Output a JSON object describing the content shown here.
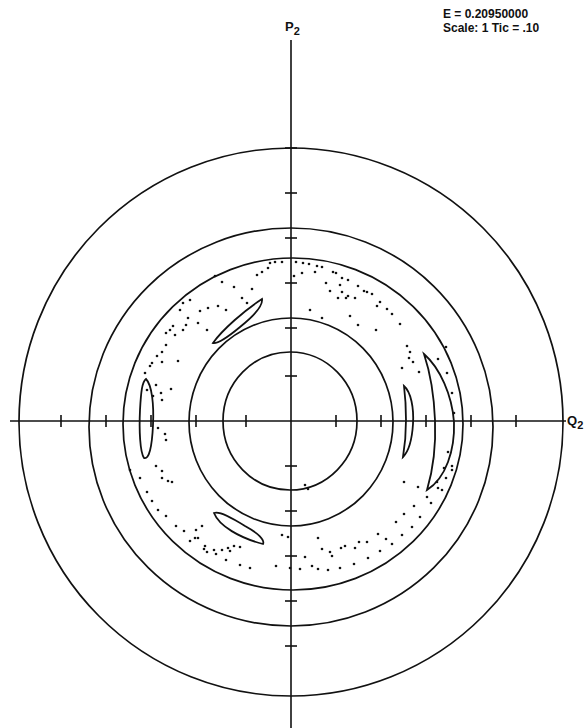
{
  "info": {
    "energy_line": "E = 0.20950000",
    "scale_line": "Scale: 1 Tic = .10"
  },
  "axes": {
    "y_label_main": "P",
    "y_label_sub": "2",
    "x_label_main": "Q",
    "x_label_sub": "2"
  },
  "chart_data": {
    "type": "scatter",
    "xlabel": "Q2",
    "ylabel": "P2",
    "annotations": [
      "E = 0.20950000",
      "Scale: 1 Tic = .10"
    ],
    "tick_spacing": 0.1,
    "xlim": [
      -0.62,
      0.62
    ],
    "ylim": [
      -0.67,
      0.92
    ],
    "grid": false,
    "legend": null,
    "pixel_geometry": {
      "center": [
        291,
        421
      ],
      "px_per_tick": 45,
      "x_axis_extent": [
        10,
        566
      ],
      "y_axis_extent": [
        40,
        728
      ],
      "x_ticks_px": [
        61,
        106,
        151,
        196,
        246,
        336,
        381,
        426,
        471,
        516
      ],
      "y_ticks_px": [
        148,
        193,
        238,
        283,
        328,
        376,
        466,
        511,
        556,
        601,
        646
      ]
    },
    "invariant_curves": [
      {
        "name": "outer-torus",
        "cx": 291,
        "cy": 422,
        "rx": 272,
        "ry": 274,
        "radius_units": 0.61
      },
      {
        "name": "torus-2",
        "cx": 291,
        "cy": 427,
        "rx": 202,
        "ry": 199,
        "radius_units": 0.45
      },
      {
        "name": "chaotic-band-outer",
        "cx": 293,
        "cy": 424,
        "rx": 170,
        "ry": 166,
        "radius_units": 0.37
      },
      {
        "name": "torus-4",
        "cx": 291,
        "cy": 422,
        "rx": 102,
        "ry": 104,
        "radius_units": 0.23
      },
      {
        "name": "inner-torus",
        "cx": 290,
        "cy": 421,
        "rx": 67,
        "ry": 69,
        "radius_units": 0.15
      }
    ],
    "islands": [
      {
        "name": "island-right-large",
        "path": "M424,354 C440,368 452,395 454,422 C455,450 446,478 427,490 C433,470 436,445 435,420 C434,395 430,372 424,354 Z"
      },
      {
        "name": "island-right-small",
        "path": "M404,386 C411,392 414,408 413,424 C412,440 408,452 403,457 C405,445 406,432 406,420 C406,405 405,394 404,386 Z"
      },
      {
        "name": "island-left",
        "path": "M146,379 C152,385 154,405 153,425 C152,447 149,460 144,458 C140,452 139,430 140,410 C141,392 142,382 146,379 Z"
      },
      {
        "name": "island-upper-left",
        "path": "M213,343 C222,330 245,310 262,299 C263,305 255,315 240,327 C228,337 218,344 213,343 Z"
      },
      {
        "name": "island-lower-left",
        "path": "M214,513 C219,526 240,538 263,544 C265,540 258,533 245,526 C232,518 220,511 214,513 Z"
      }
    ],
    "chaotic_points": [
      [
        296,
        262
      ],
      [
        303,
        263
      ],
      [
        309,
        264
      ],
      [
        317,
        266
      ],
      [
        322,
        267
      ],
      [
        333,
        272
      ],
      [
        336,
        273
      ],
      [
        342,
        278
      ],
      [
        348,
        280
      ],
      [
        358,
        286
      ],
      [
        364,
        291
      ],
      [
        372,
        294
      ],
      [
        380,
        302
      ],
      [
        294,
        276
      ],
      [
        302,
        273
      ],
      [
        315,
        272
      ],
      [
        326,
        283
      ],
      [
        330,
        291
      ],
      [
        340,
        285
      ],
      [
        342,
        292
      ],
      [
        338,
        298
      ],
      [
        346,
        298
      ],
      [
        348,
        296
      ],
      [
        355,
        298
      ],
      [
        367,
        292
      ],
      [
        377,
        306
      ],
      [
        387,
        309
      ],
      [
        310,
        310
      ],
      [
        322,
        318
      ],
      [
        350,
        316
      ],
      [
        358,
        325
      ],
      [
        376,
        330
      ],
      [
        392,
        314
      ],
      [
        400,
        324
      ],
      [
        407,
        346
      ],
      [
        410,
        352
      ],
      [
        409,
        358
      ],
      [
        413,
        362
      ],
      [
        402,
        368
      ],
      [
        419,
        372
      ],
      [
        446,
        347
      ],
      [
        438,
        359
      ],
      [
        447,
        373
      ],
      [
        452,
        393
      ],
      [
        454,
        413
      ],
      [
        448,
        452
      ],
      [
        444,
        468
      ],
      [
        437,
        482
      ],
      [
        418,
        487
      ],
      [
        404,
        482
      ],
      [
        431,
        503
      ],
      [
        442,
        490
      ],
      [
        452,
        470
      ],
      [
        215,
        276
      ],
      [
        222,
        282
      ],
      [
        234,
        287
      ],
      [
        242,
        298
      ],
      [
        247,
        303
      ],
      [
        252,
        289
      ],
      [
        257,
        275
      ],
      [
        262,
        272
      ],
      [
        270,
        263
      ],
      [
        275,
        262
      ],
      [
        282,
        262
      ],
      [
        268,
        268
      ],
      [
        183,
        303
      ],
      [
        190,
        300
      ],
      [
        200,
        311
      ],
      [
        208,
        308
      ],
      [
        218,
        306
      ],
      [
        226,
        310
      ],
      [
        186,
        325
      ],
      [
        175,
        335
      ],
      [
        166,
        345
      ],
      [
        162,
        352
      ],
      [
        157,
        356
      ],
      [
        152,
        363
      ],
      [
        145,
        373
      ],
      [
        150,
        366
      ],
      [
        166,
        333
      ],
      [
        170,
        330
      ],
      [
        173,
        326
      ],
      [
        180,
        310
      ],
      [
        188,
        318
      ],
      [
        198,
        323
      ],
      [
        207,
        330
      ],
      [
        183,
        330
      ],
      [
        178,
        361
      ],
      [
        162,
        362
      ],
      [
        171,
        389
      ],
      [
        147,
        390
      ],
      [
        153,
        396
      ],
      [
        156,
        385
      ],
      [
        161,
        393
      ],
      [
        162,
        400
      ],
      [
        158,
        428
      ],
      [
        165,
        434
      ],
      [
        166,
        440
      ],
      [
        156,
        466
      ],
      [
        162,
        471
      ],
      [
        162,
        478
      ],
      [
        168,
        481
      ],
      [
        172,
        482
      ],
      [
        130,
        470
      ],
      [
        140,
        478
      ],
      [
        147,
        492
      ],
      [
        152,
        501
      ],
      [
        158,
        510
      ],
      [
        166,
        516
      ],
      [
        176,
        526
      ],
      [
        184,
        531
      ],
      [
        195,
        538
      ],
      [
        205,
        546
      ],
      [
        216,
        554
      ],
      [
        226,
        560
      ],
      [
        240,
        565
      ],
      [
        250,
        568
      ],
      [
        204,
        549
      ],
      [
        207,
        552
      ],
      [
        214,
        550
      ],
      [
        222,
        550
      ],
      [
        228,
        548
      ],
      [
        230,
        551
      ],
      [
        234,
        546
      ],
      [
        240,
        547
      ],
      [
        198,
        538
      ],
      [
        196,
        530
      ],
      [
        202,
        526
      ],
      [
        190,
        541
      ],
      [
        305,
        485
      ],
      [
        308,
        489
      ],
      [
        318,
        538
      ],
      [
        322,
        549
      ],
      [
        330,
        552
      ],
      [
        332,
        556
      ],
      [
        341,
        548
      ],
      [
        345,
        546
      ],
      [
        355,
        548
      ],
      [
        359,
        542
      ],
      [
        367,
        542
      ],
      [
        378,
        534
      ],
      [
        386,
        539
      ],
      [
        396,
        522
      ],
      [
        404,
        514
      ],
      [
        414,
        506
      ],
      [
        427,
        497
      ],
      [
        438,
        488
      ],
      [
        446,
        478
      ],
      [
        452,
        466
      ],
      [
        305,
        557
      ],
      [
        312,
        566
      ],
      [
        318,
        569
      ],
      [
        328,
        570
      ],
      [
        340,
        568
      ],
      [
        354,
        564
      ],
      [
        368,
        558
      ],
      [
        380,
        551
      ],
      [
        392,
        544
      ],
      [
        402,
        535
      ],
      [
        412,
        527
      ],
      [
        420,
        517
      ],
      [
        288,
        537
      ],
      [
        282,
        535
      ],
      [
        276,
        566
      ],
      [
        290,
        568
      ],
      [
        300,
        569
      ]
    ]
  }
}
